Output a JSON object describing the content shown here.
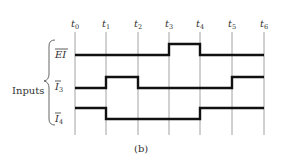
{
  "diagram": {
    "type": "timing-diagram",
    "caption": "(b)",
    "group_label": "Inputs",
    "time_markers": [
      {
        "base": "t",
        "sub": "0"
      },
      {
        "base": "t",
        "sub": "1"
      },
      {
        "base": "t",
        "sub": "2"
      },
      {
        "base": "t",
        "sub": "3"
      },
      {
        "base": "t",
        "sub": "4"
      },
      {
        "base": "t",
        "sub": "5"
      },
      {
        "base": "t",
        "sub": "6"
      }
    ],
    "signals": [
      {
        "name": "EI",
        "overbar": true,
        "label_base": "EI",
        "label_sub": "",
        "levels": [
          0,
          0,
          0,
          1,
          0,
          0
        ]
      },
      {
        "name": "I3",
        "overbar": true,
        "label_base": "I",
        "label_sub": "3",
        "levels": [
          0,
          1,
          0,
          0,
          0,
          1
        ]
      },
      {
        "name": "I4",
        "overbar": true,
        "label_base": "I",
        "label_sub": "4",
        "levels": [
          1,
          0,
          0,
          0,
          1,
          1
        ]
      }
    ]
  }
}
